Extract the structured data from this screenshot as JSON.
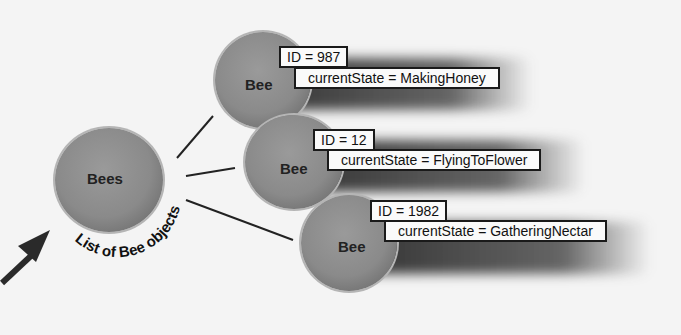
{
  "diagram": {
    "list_node": {
      "label": "Bees",
      "caption": "List of Bee objects"
    },
    "bees": [
      {
        "label": "Bee",
        "id_text": "ID = 987",
        "state_text": "currentState = MakingHoney"
      },
      {
        "label": "Bee",
        "id_text": "ID = 12",
        "state_text": "currentState = FlyingToFlower"
      },
      {
        "label": "Bee",
        "id_text": "ID = 1982",
        "state_text": "currentState = GatheringNectar"
      }
    ]
  }
}
